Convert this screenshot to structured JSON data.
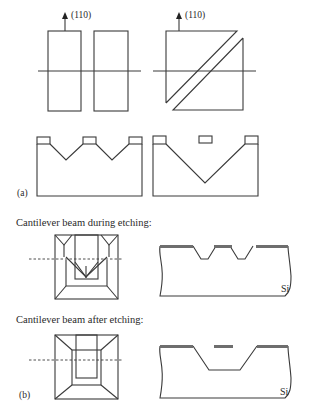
{
  "panel_a": {
    "label": "(a)",
    "orientation_label_left": "(110)",
    "orientation_label_right": "(110)"
  },
  "panel_b": {
    "label": "(b)",
    "caption_during": "Cantilever beam during etching:",
    "caption_after": "Cantilever beam after etching:",
    "substrate_label_during": "Si",
    "substrate_label_after": "Si"
  },
  "colors": {
    "line": "#3a3a3a",
    "mask": "#6e6e6e",
    "background": "#ffffff"
  }
}
